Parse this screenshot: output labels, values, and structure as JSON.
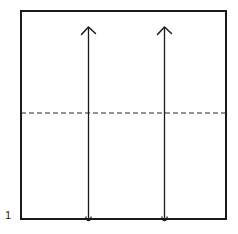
{
  "figure": {
    "background_color": "#ffffff",
    "ink_color": "#1a1a1a",
    "step_number": "1"
  },
  "paper_square": {
    "name": "square sheet outline",
    "stroke_color": "#1a1a1a",
    "stroke_width": 1.6,
    "fill": "#ffffff",
    "x": 21,
    "y": 11,
    "width": 205,
    "height": 208
  },
  "fold_line": {
    "name": "horizontal valley fold crease",
    "style": "dashed",
    "stroke_color": "#2b2b2b",
    "stroke_width": 1.2,
    "dash_pattern": "5,3",
    "x1": 21,
    "y1": 113,
    "x2": 226,
    "y2": 113
  },
  "arrows": [
    {
      "name": "left fold arrow",
      "direction": "up",
      "stroke_color": "#1a1a1a",
      "stroke_width": 1.3,
      "x": 88.5,
      "y_tail": 218,
      "y_tip": 27,
      "head_style": "barbed",
      "has_tail_loop": true
    },
    {
      "name": "right fold arrow",
      "direction": "up",
      "stroke_color": "#1a1a1a",
      "stroke_width": 1.3,
      "x": 164.5,
      "y_tail": 218,
      "y_tip": 27,
      "head_style": "barbed",
      "has_tail_loop": true
    }
  ],
  "labels": {
    "step": {
      "text": "1",
      "x": 5,
      "y": 219
    }
  }
}
